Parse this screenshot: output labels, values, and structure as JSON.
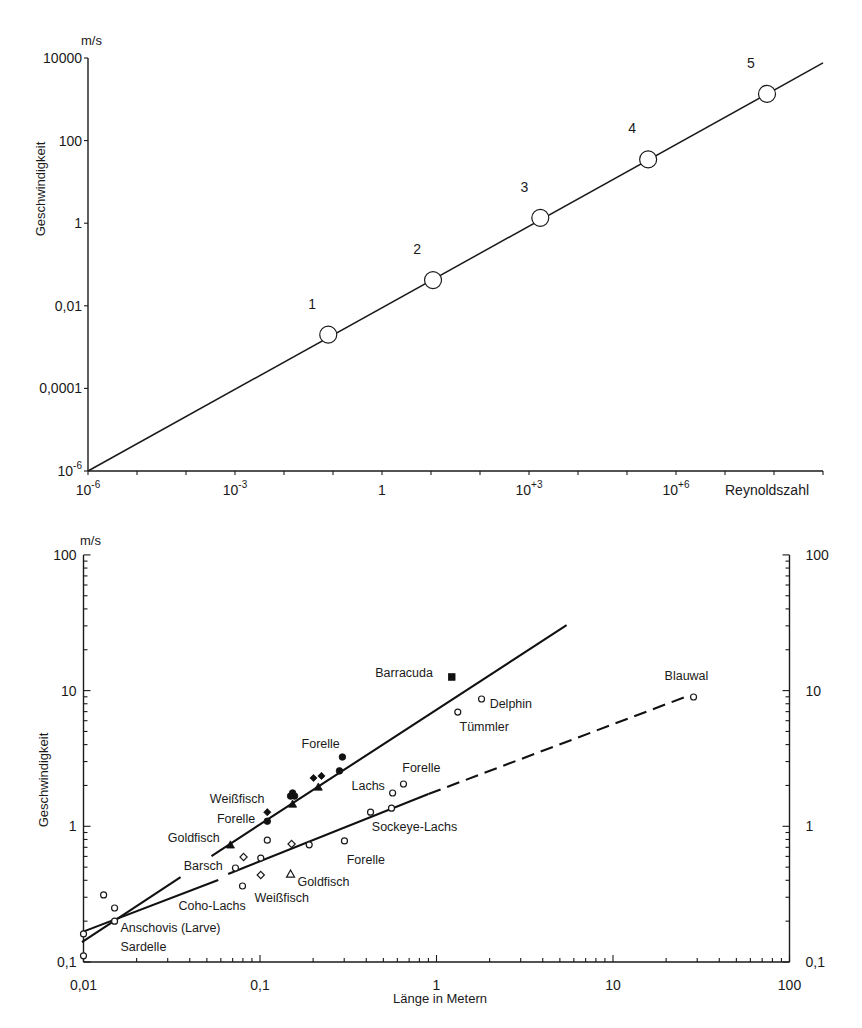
{
  "chart_data": [
    {
      "id": "reynolds",
      "type": "line",
      "title": "",
      "xlabel": "Reynoldszahl",
      "ylabel": "Geschwindigkeit",
      "y_unit": "m/s",
      "x_scale": "log",
      "y_scale": "log",
      "xlim": [
        1e-06,
        1000000000.0
      ],
      "ylim": [
        1e-06,
        10000.0
      ],
      "grid": false,
      "legend": "none",
      "x_ticks": [
        {
          "value": 1e-06,
          "label": "10",
          "exp": "-6"
        },
        {
          "value": 0.001,
          "label": "10",
          "exp": "-3"
        },
        {
          "value": 1,
          "label": "1",
          "exp": ""
        },
        {
          "value": 1000.0,
          "label": "10",
          "exp": "+3"
        },
        {
          "value": 1000000.0,
          "label": "10",
          "exp": "+6"
        }
      ],
      "y_ticks": [
        {
          "value": 10000.0,
          "label": "10000",
          "exp": ""
        },
        {
          "value": 100,
          "label": "100",
          "exp": ""
        },
        {
          "value": 1,
          "label": "1",
          "exp": ""
        },
        {
          "value": 0.01,
          "label": "0,01",
          "exp": ""
        },
        {
          "value": 0.0001,
          "label": "0,0001",
          "exp": ""
        },
        {
          "value": 1e-06,
          "label": "10",
          "exp": "-6"
        }
      ],
      "series": [
        {
          "id": "speed_vs_reynolds",
          "x": [
            1e-06,
            1000000000.0
          ],
          "y": [
            1e-06,
            7600
          ],
          "style": "solid"
        }
      ],
      "markers": [
        {
          "label": "1",
          "x": 0.08,
          "y": 0.002
        },
        {
          "label": "2",
          "x": 11,
          "y": 0.042
        },
        {
          "label": "3",
          "x": 1700,
          "y": 1.35
        },
        {
          "label": "4",
          "x": 270000,
          "y": 35
        },
        {
          "label": "5",
          "x": 72000000,
          "y": 1350
        }
      ]
    },
    {
      "id": "laenge",
      "type": "scatter",
      "title": "",
      "xlabel": "Länge in Metern",
      "ylabel": "Geschwindigkeit",
      "y_unit": "m/s",
      "x_scale": "log",
      "y_scale": "log",
      "xlim": [
        0.01,
        100
      ],
      "ylim": [
        0.1,
        100
      ],
      "grid": false,
      "legend": "none",
      "secondary_y_axis": true,
      "x_ticks": [
        {
          "value": 0.01,
          "label": "0,01"
        },
        {
          "value": 0.1,
          "label": "0,1"
        },
        {
          "value": 1,
          "label": "1"
        },
        {
          "value": 10,
          "label": "10"
        },
        {
          "value": 100,
          "label": "100"
        }
      ],
      "y_ticks": [
        {
          "value": 0.1,
          "label": "0,1"
        },
        {
          "value": 1,
          "label": "1"
        },
        {
          "value": 10,
          "label": "10"
        },
        {
          "value": 100,
          "label": "100"
        }
      ],
      "y2_ticks": [
        {
          "value": 0.1,
          "label": "0,1"
        },
        {
          "value": 1,
          "label": "1"
        },
        {
          "value": 10,
          "label": "10"
        },
        {
          "value": 100,
          "label": "100"
        }
      ],
      "series": [
        {
          "id": "steep_line",
          "segments": [
            {
              "x": [
                0.0098,
                0.0355
              ],
              "y": [
                0.14,
                0.423
              ],
              "style": "solid"
            },
            {
              "x": [
                0.0531,
                5.46
              ],
              "y": [
                0.604,
                30.4
              ],
              "style": "solid"
            }
          ]
        },
        {
          "id": "shallow_line",
          "segments": [
            {
              "x": [
                0.0098,
                0.058
              ],
              "y": [
                0.166,
                0.402
              ],
              "style": "solid"
            },
            {
              "x": [
                0.066,
                0.9
              ],
              "y": [
                0.445,
                1.73
              ],
              "style": "solid"
            },
            {
              "x": [
                0.9,
                26.4
              ],
              "y": [
                1.73,
                9.1
              ],
              "style": "dashed"
            }
          ]
        }
      ],
      "points": [
        {
          "x": 1.22,
          "y": 12.6,
          "marker": "filled-square"
        },
        {
          "x": 1.8,
          "y": 8.67,
          "marker": "open-circle"
        },
        {
          "x": 1.32,
          "y": 6.95,
          "marker": "open-circle"
        },
        {
          "x": 28.6,
          "y": 8.97,
          "marker": "open-circle"
        },
        {
          "x": 0.293,
          "y": 3.24,
          "marker": "filled-circle"
        },
        {
          "x": 0.282,
          "y": 2.56,
          "marker": "filled-circle"
        },
        {
          "x": 0.201,
          "y": 2.27,
          "marker": "filled-diamond"
        },
        {
          "x": 0.223,
          "y": 2.35,
          "marker": "filled-diamond"
        },
        {
          "x": 0.214,
          "y": 1.95,
          "marker": "filled-triangle"
        },
        {
          "x": 0.153,
          "y": 1.76,
          "marker": "filled-circle"
        },
        {
          "x": 0.149,
          "y": 1.67,
          "marker": "filled-circle"
        },
        {
          "x": 0.157,
          "y": 1.67,
          "marker": "filled-circle"
        },
        {
          "x": 0.153,
          "y": 1.46,
          "marker": "filled-triangle"
        },
        {
          "x": 0.11,
          "y": 1.27,
          "marker": "filled-diamond"
        },
        {
          "x": 0.11,
          "y": 1.09,
          "marker": "filled-circle"
        },
        {
          "x": 0.068,
          "y": 0.73,
          "marker": "filled-triangle"
        },
        {
          "x": 0.11,
          "y": 0.79,
          "marker": "open-circle"
        },
        {
          "x": 0.151,
          "y": 0.74,
          "marker": "open-diamond"
        },
        {
          "x": 0.19,
          "y": 0.73,
          "marker": "open-circle"
        },
        {
          "x": 0.301,
          "y": 0.78,
          "marker": "open-circle"
        },
        {
          "x": 0.423,
          "y": 1.27,
          "marker": "open-circle"
        },
        {
          "x": 0.556,
          "y": 1.36,
          "marker": "open-circle"
        },
        {
          "x": 0.564,
          "y": 1.76,
          "marker": "open-circle"
        },
        {
          "x": 0.65,
          "y": 2.05,
          "marker": "open-circle"
        },
        {
          "x": 0.0726,
          "y": 0.493,
          "marker": "open-circle"
        },
        {
          "x": 0.0807,
          "y": 0.594,
          "marker": "open-diamond"
        },
        {
          "x": 0.101,
          "y": 0.583,
          "marker": "open-circle"
        },
        {
          "x": 0.0796,
          "y": 0.363,
          "marker": "open-circle"
        },
        {
          "x": 0.101,
          "y": 0.438,
          "marker": "open-diamond"
        },
        {
          "x": 0.149,
          "y": 0.445,
          "marker": "open-triangle"
        },
        {
          "x": 0.013,
          "y": 0.312,
          "marker": "open-circle"
        },
        {
          "x": 0.015,
          "y": 0.25,
          "marker": "open-circle"
        },
        {
          "x": 0.015,
          "y": 0.2,
          "marker": "open-circle"
        },
        {
          "x": 0.01,
          "y": 0.161,
          "marker": "open-circle"
        },
        {
          "x": 0.01,
          "y": 0.111,
          "marker": "open-circle"
        }
      ],
      "annotations": [
        {
          "text": "Barracuda",
          "x": 0.45,
          "y": 13.5
        },
        {
          "text": "Delphin",
          "x": 2.0,
          "y": 8.0
        },
        {
          "text": "Tümmler",
          "x": 1.35,
          "y": 5.4
        },
        {
          "text": "Blauwal",
          "x": 19.6,
          "y": 13.0
        },
        {
          "text": "Forelle",
          "x": 0.172,
          "y": 4.1
        },
        {
          "text": "Forelle",
          "x": 0.64,
          "y": 2.7
        },
        {
          "text": "Lachs",
          "x": 0.33,
          "y": 2.0
        },
        {
          "text": "Weißfisch",
          "x": 0.052,
          "y": 1.6
        },
        {
          "text": "Forelle",
          "x": 0.057,
          "y": 1.15
        },
        {
          "text": "Goldfisch",
          "x": 0.03,
          "y": 0.82
        },
        {
          "text": "Sockeye-Lachs",
          "x": 0.43,
          "y": 0.99
        },
        {
          "text": "Barsch",
          "x": 0.037,
          "y": 0.51
        },
        {
          "text": "Forelle",
          "x": 0.31,
          "y": 0.57
        },
        {
          "text": "Goldfisch",
          "x": 0.163,
          "y": 0.39
        },
        {
          "text": "Weißfisch",
          "x": 0.093,
          "y": 0.3
        },
        {
          "text": "Coho-Lachs",
          "x": 0.0345,
          "y": 0.26
        },
        {
          "text": "Anschovis (Larve)",
          "x": 0.0162,
          "y": 0.18
        },
        {
          "text": "Sardelle",
          "x": 0.0162,
          "y": 0.131
        }
      ]
    }
  ]
}
